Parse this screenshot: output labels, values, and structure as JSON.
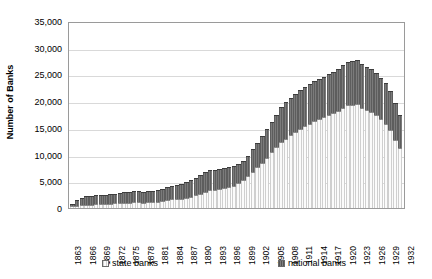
{
  "chart_data": {
    "type": "bar",
    "stacked": true,
    "title": "",
    "xlabel": "",
    "ylabel": "Number of Banks",
    "ylim": [
      0,
      35000
    ],
    "ytick_step": 5000,
    "yticks": [
      "35,000",
      "30,000",
      "25,000",
      "20,000",
      "15,000",
      "10,000",
      "5,000",
      "0"
    ],
    "ytick_values": [
      35000,
      30000,
      25000,
      20000,
      15000,
      10000,
      5000,
      0
    ],
    "grid": true,
    "legend_position": "bottom",
    "xtick_step": 3,
    "xtick_labels": [
      "1863",
      "1866",
      "1869",
      "1872",
      "1875",
      "1878",
      "1881",
      "1884",
      "1887",
      "1890",
      "1893",
      "1896",
      "1899",
      "1902",
      "1905",
      "1908",
      "1911",
      "1914",
      "1917",
      "1920",
      "1923",
      "1926",
      "1929",
      "1932"
    ],
    "categories": [
      1863,
      1864,
      1865,
      1866,
      1867,
      1868,
      1869,
      1870,
      1871,
      1872,
      1873,
      1874,
      1875,
      1876,
      1877,
      1878,
      1879,
      1880,
      1881,
      1882,
      1883,
      1884,
      1885,
      1886,
      1887,
      1888,
      1889,
      1890,
      1891,
      1892,
      1893,
      1894,
      1895,
      1896,
      1897,
      1898,
      1899,
      1900,
      1901,
      1902,
      1903,
      1904,
      1905,
      1906,
      1907,
      1908,
      1909,
      1910,
      1911,
      1912,
      1913,
      1914,
      1915,
      1916,
      1917,
      1918,
      1919,
      1920,
      1921,
      1922,
      1923,
      1924,
      1925,
      1926,
      1927,
      1928,
      1929,
      1930,
      1931,
      1932
    ],
    "series": [
      {
        "name": "state banks",
        "color": "#f2f2f2",
        "values": [
          300,
          400,
          500,
          600,
          650,
          700,
          700,
          750,
          800,
          850,
          900,
          950,
          1000,
          1050,
          1050,
          1000,
          1050,
          1100,
          1200,
          1350,
          1500,
          1600,
          1650,
          1750,
          1900,
          2100,
          2400,
          2700,
          3000,
          3300,
          3400,
          3500,
          3800,
          4000,
          4200,
          4600,
          5200,
          6000,
          6800,
          7600,
          8500,
          9400,
          10400,
          11400,
          12400,
          13000,
          13600,
          14200,
          14800,
          15300,
          15800,
          16200,
          16600,
          17000,
          17400,
          17800,
          18200,
          18800,
          19200,
          19300,
          19400,
          18800,
          18400,
          18000,
          17400,
          16600,
          15800,
          14600,
          12800,
          11200
        ]
      },
      {
        "name": "national banks",
        "color": "#6f6f6f",
        "values": [
          400,
          1100,
          1400,
          1600,
          1650,
          1650,
          1650,
          1650,
          1750,
          1850,
          1950,
          2000,
          2050,
          2080,
          2080,
          2050,
          2050,
          2080,
          2100,
          2250,
          2450,
          2600,
          2700,
          2800,
          3000,
          3100,
          3300,
          3500,
          3650,
          3750,
          3800,
          3750,
          3700,
          3700,
          3600,
          3580,
          3580,
          3730,
          4160,
          4530,
          4930,
          5330,
          5660,
          6040,
          6430,
          6820,
          6950,
          7140,
          7270,
          7370,
          7470,
          7520,
          7590,
          7570,
          7600,
          7690,
          7780,
          8020,
          8150,
          8240,
          8240,
          8080,
          8070,
          7980,
          7790,
          7690,
          7530,
          7250,
          6800,
          6150
        ]
      }
    ],
    "totals_note": "Stacked total peaks near 30,000 around 1921"
  },
  "legend": {
    "state_label": "state banks",
    "national_label": "national banks"
  },
  "axis": {
    "y_title": "Number of Banks"
  }
}
